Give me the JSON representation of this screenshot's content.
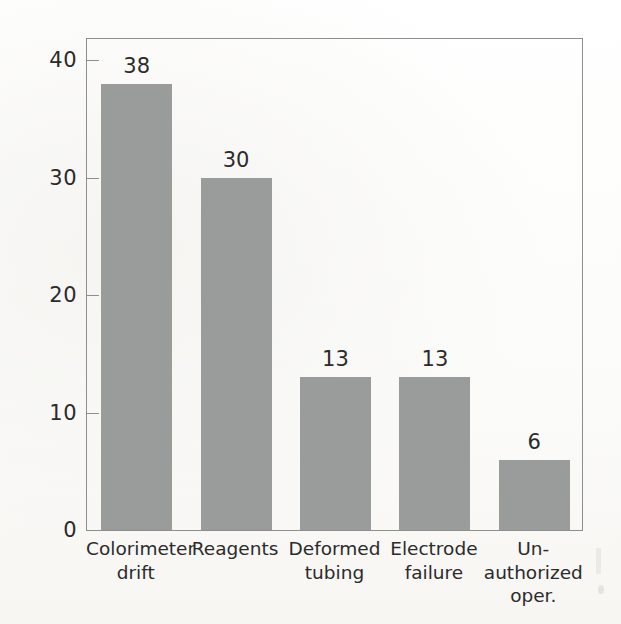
{
  "chart_data": {
    "type": "bar",
    "title": "",
    "subtitle": "",
    "xlabel": "",
    "ylabel": "Percent of downtime",
    "ylim": [
      0,
      42
    ],
    "yticks": [
      0,
      10,
      20,
      30,
      40
    ],
    "ytick_labels": [
      "0",
      "10",
      "20",
      "30",
      "40"
    ],
    "grid": false,
    "legend": "none",
    "bar_color": "#9a9b9b",
    "axis_color": "#8e8e8e",
    "text_color": "#2b2b2b",
    "categories": [
      "Colorimeter\ndrift",
      "Reagents",
      "Deformed\ntubing",
      "Electrode\nfailure",
      "Un-\nauthorized\noper."
    ],
    "values": [
      38,
      30,
      13,
      13,
      6
    ],
    "value_labels": [
      "38",
      "30",
      "13",
      "13",
      "6"
    ],
    "annotations": []
  },
  "figure": {
    "background": "#fdfdfc",
    "page_artifact_note": ""
  }
}
